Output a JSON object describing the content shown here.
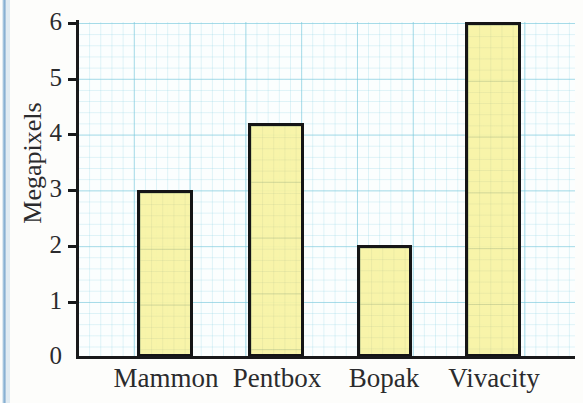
{
  "chart_data": {
    "type": "bar",
    "title": "",
    "xlabel": "",
    "ylabel": "Megapixels",
    "categories": [
      "Mammon",
      "Pentbox",
      "Bopak",
      "Vivacity"
    ],
    "values": [
      3,
      4.2,
      2,
      6
    ],
    "ylim": [
      0,
      6
    ],
    "yticks": [
      0,
      1,
      2,
      3,
      4,
      5,
      6
    ],
    "ytick_labels": [
      "0",
      "1",
      "2",
      "3",
      "4",
      "5",
      "6"
    ],
    "grid": true,
    "legend": "none",
    "bar_fill_color": "#F8F3A3",
    "bar_edge_color": "#151516",
    "grid_color": "#78C8DC",
    "background_color": "#FBFEFE",
    "series": [
      {
        "name": "Megapixels",
        "values": [
          3,
          4.2,
          2,
          6
        ]
      }
    ]
  },
  "axes": {
    "y_title": "Megapixels",
    "y_tick_labels": [
      "6",
      "5",
      "4",
      "3",
      "2",
      "1",
      "0"
    ]
  },
  "categories": {
    "items": [
      {
        "label": "Mammon",
        "value": 3
      },
      {
        "label": "Pentbox",
        "value": 4.2
      },
      {
        "label": "Bopak",
        "value": 2
      },
      {
        "label": "Vivacity",
        "value": 6
      }
    ]
  }
}
